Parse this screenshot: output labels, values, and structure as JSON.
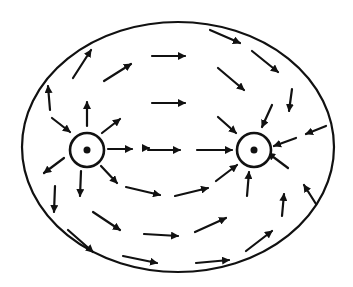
{
  "diagram": {
    "title": "",
    "colors": {
      "ink": "#111111",
      "background": "#ffffff"
    },
    "boundary": {
      "cx": 178,
      "cy": 147,
      "rx": 156,
      "ry": 125
    },
    "charges": [
      {
        "id": "left",
        "cx": 87,
        "cy": 150,
        "r": 17,
        "role": "source"
      },
      {
        "id": "right",
        "cx": 254,
        "cy": 150,
        "r": 17,
        "role": "sink"
      }
    ],
    "arrows": [
      {
        "x1": 73,
        "y1": 78,
        "x2": 91,
        "y2": 50
      },
      {
        "x1": 104,
        "y1": 81,
        "x2": 131,
        "y2": 64
      },
      {
        "x1": 152,
        "y1": 56,
        "x2": 185,
        "y2": 56
      },
      {
        "x1": 210,
        "y1": 30,
        "x2": 240,
        "y2": 43
      },
      {
        "x1": 252,
        "y1": 51,
        "x2": 278,
        "y2": 72
      },
      {
        "x1": 218,
        "y1": 68,
        "x2": 244,
        "y2": 90
      },
      {
        "x1": 152,
        "y1": 103,
        "x2": 185,
        "y2": 103
      },
      {
        "x1": 50,
        "y1": 110,
        "x2": 48,
        "y2": 86
      },
      {
        "x1": 87,
        "y1": 126,
        "x2": 87,
        "y2": 102
      },
      {
        "x1": 52,
        "y1": 118,
        "x2": 70,
        "y2": 132
      },
      {
        "x1": 102,
        "y1": 133,
        "x2": 120,
        "y2": 119
      },
      {
        "x1": 292,
        "y1": 89,
        "x2": 289,
        "y2": 111
      },
      {
        "x1": 272,
        "y1": 105,
        "x2": 262,
        "y2": 127
      },
      {
        "x1": 218,
        "y1": 117,
        "x2": 236,
        "y2": 133
      },
      {
        "x1": 326,
        "y1": 126,
        "x2": 306,
        "y2": 134
      },
      {
        "x1": 296,
        "y1": 138,
        "x2": 274,
        "y2": 146
      },
      {
        "x1": 108,
        "y1": 149,
        "x2": 132,
        "y2": 149
      },
      {
        "x1": 148,
        "y1": 150,
        "x2": 180,
        "y2": 150
      },
      {
        "x1": 197,
        "y1": 150,
        "x2": 232,
        "y2": 150
      },
      {
        "x1": 64,
        "y1": 158,
        "x2": 44,
        "y2": 173
      },
      {
        "x1": 81,
        "y1": 171,
        "x2": 80,
        "y2": 196
      },
      {
        "x1": 55,
        "y1": 186,
        "x2": 54,
        "y2": 212
      },
      {
        "x1": 101,
        "y1": 166,
        "x2": 117,
        "y2": 183
      },
      {
        "x1": 126,
        "y1": 187,
        "x2": 160,
        "y2": 195
      },
      {
        "x1": 175,
        "y1": 196,
        "x2": 208,
        "y2": 188
      },
      {
        "x1": 216,
        "y1": 181,
        "x2": 237,
        "y2": 165
      },
      {
        "x1": 247,
        "y1": 196,
        "x2": 249,
        "y2": 172
      },
      {
        "x1": 288,
        "y1": 168,
        "x2": 268,
        "y2": 153
      },
      {
        "x1": 282,
        "y1": 216,
        "x2": 284,
        "y2": 194
      },
      {
        "x1": 316,
        "y1": 204,
        "x2": 304,
        "y2": 185
      },
      {
        "x1": 93,
        "y1": 212,
        "x2": 120,
        "y2": 230
      },
      {
        "x1": 144,
        "y1": 234,
        "x2": 178,
        "y2": 236
      },
      {
        "x1": 195,
        "y1": 232,
        "x2": 226,
        "y2": 218
      },
      {
        "x1": 246,
        "y1": 251,
        "x2": 272,
        "y2": 231
      },
      {
        "x1": 68,
        "y1": 230,
        "x2": 93,
        "y2": 252
      },
      {
        "x1": 123,
        "y1": 256,
        "x2": 157,
        "y2": 263
      },
      {
        "x1": 196,
        "y1": 263,
        "x2": 229,
        "y2": 260
      },
      {
        "x1": 143,
        "y1": 148,
        "x2": 149,
        "y2": 148
      }
    ]
  }
}
